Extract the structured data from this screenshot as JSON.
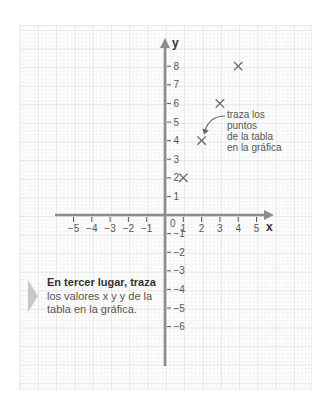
{
  "annotation": {
    "lines": [
      "traza los",
      "puntos",
      "de la tabla",
      "en la gráfica"
    ]
  },
  "callout": {
    "bold": "En tercer lugar, traza",
    "lines": [
      "los valores x y y de la",
      "tabla en la gráfica."
    ]
  },
  "colors": {
    "axis": "#8c8c8c",
    "marker": "#666666",
    "tick_text": "#555555",
    "axis_label": "#333333",
    "pointer": "#c8c8c8"
  },
  "chart_data": {
    "type": "scatter",
    "title": "",
    "xlabel": "x",
    "ylabel": "y",
    "xlim": [
      -5,
      5
    ],
    "ylim": [
      -6,
      8
    ],
    "x_ticks": [
      -5,
      -4,
      -3,
      -2,
      -1,
      0,
      1,
      2,
      3,
      4,
      5
    ],
    "y_ticks": [
      -6,
      -5,
      -4,
      -3,
      -2,
      -1,
      1,
      2,
      3,
      4,
      5,
      6,
      7,
      8
    ],
    "grid": true,
    "legend": null,
    "series": [
      {
        "name": "puntos de la tabla",
        "marker": "x",
        "x": [
          1,
          2,
          3,
          4
        ],
        "y": [
          2,
          4,
          6,
          8
        ]
      }
    ],
    "annotations": [
      {
        "text": "traza los puntos de la tabla en la gráfica",
        "points_to": [
          2,
          4
        ]
      }
    ]
  }
}
